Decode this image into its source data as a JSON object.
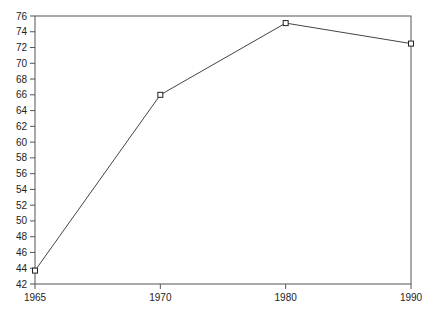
{
  "chart_data": {
    "type": "line",
    "title": "",
    "xlabel": "",
    "ylabel": "",
    "categories": [
      "1965",
      "1970",
      "1980",
      "1990"
    ],
    "series": [
      {
        "name": "series-1",
        "values": [
          43.7,
          66.0,
          75.1,
          72.5
        ],
        "marker": "square"
      }
    ],
    "ylim": [
      42,
      76
    ],
    "yticks": [
      42,
      44,
      46,
      48,
      50,
      52,
      54,
      56,
      58,
      60,
      62,
      64,
      66,
      68,
      70,
      72,
      74,
      76
    ],
    "grid": false,
    "legend": "none",
    "frame": "box"
  }
}
